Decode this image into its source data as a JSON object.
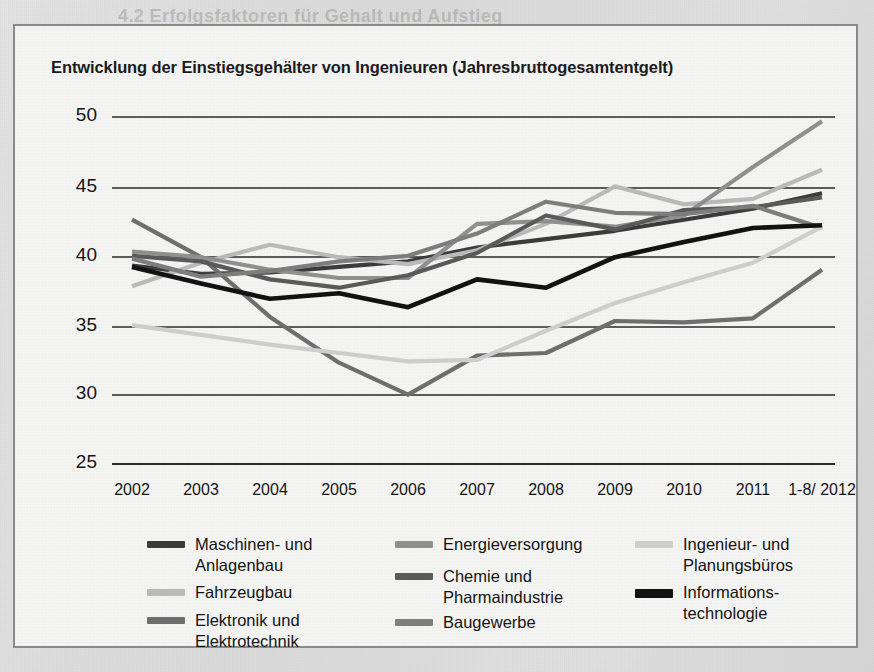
{
  "chart_card": {
    "title": "Entwicklung der Einstiegsgehälter von Ingenieuren (Jahresbruttogesamtentgelt)"
  },
  "background_bleed": [
    {
      "text": "4.2 Erfolgsfaktoren für Gehalt und Aufstieg",
      "x": 118,
      "y": 6,
      "size": 18,
      "bold": true
    },
    {
      "text": "4.2.1 Führung als Dienstleistung begreifen",
      "x": 120,
      "y": 88,
      "size": 15,
      "bold": true
    },
    {
      "text": "Wer andere motivieren und führen will, muss sich auf ihre Ansprüche einstellen und",
      "x": 122,
      "y": 140,
      "size": 12,
      "bold": false
    },
    {
      "text": "ihre Stärken erkennen. Wer gut führt, profitiert von Gestaltungsspielraum, besserer",
      "x": 122,
      "y": 168,
      "size": 12,
      "bold": false
    },
    {
      "text": "Bezahlung und mehr Ansehen. Dazu gehört es auch, Aufgaben abzugeben und",
      "x": 122,
      "y": 196,
      "size": 12,
      "bold": false
    },
    {
      "text": "Verantwortung zu delegieren. Wer alles selbst machen will, bremst das Team und",
      "x": 122,
      "y": 224,
      "size": 12,
      "bold": false
    },
    {
      "text": "sich selbst – und verliert den Blick für das Wesentliche im Unternehmen.",
      "x": 122,
      "y": 252,
      "size": 12,
      "bold": false
    },
    {
      "text": "Ein wichtiger Punkt: Investitionen in die eigene Weiterbildung zahlen sich aus.",
      "x": 122,
      "y": 300,
      "size": 12,
      "bold": false
    },
    {
      "text": "Wer Verantwortung übernimmt, muss auch Rückschläge einkalkulieren können.",
      "x": 122,
      "y": 328,
      "size": 12,
      "bold": false
    },
    {
      "text": "Planungssicherheit für den Arbeitgeber ist ein entscheidender Faktor.",
      "x": 122,
      "y": 356,
      "size": 12,
      "bold": false
    },
    {
      "text": "Ingenieure sind gefragt wie nie zuvor auf dem deutschen Arbeitsmarkt.",
      "x": 40,
      "y": 402,
      "size": 12,
      "bold": false
    },
    {
      "text": "53",
      "x": 810,
      "y": 636,
      "size": 13,
      "bold": true
    }
  ],
  "chart_data": {
    "type": "line",
    "title": "Entwicklung der Einstiegsgehälter von Ingenieuren (Jahresbruttogesamtentgelt)",
    "xlabel": "",
    "ylabel": "",
    "ylim": [
      25,
      50
    ],
    "yticks": [
      50,
      45,
      40,
      35,
      30,
      25
    ],
    "grid": true,
    "legend_position": "bottom",
    "categories": [
      "2002",
      "2003",
      "2004",
      "2005",
      "2006",
      "2007",
      "2008",
      "2009",
      "2010",
      "2011",
      "1-8/\n2012"
    ],
    "x_tick_labels": [
      "2002",
      "2003",
      "2004",
      "2005",
      "2006",
      "2007",
      "2008",
      "2009",
      "2010",
      "2011",
      "1-8/\n2012"
    ],
    "series": [
      {
        "name": "Maschinen- und\nAnlagenbau",
        "color": "#3b3b3b",
        "width": 4.2,
        "values": [
          39.3,
          38.7,
          38.8,
          39.2,
          39.6,
          40.6,
          41.2,
          41.8,
          42.6,
          43.4,
          44.5
        ]
      },
      {
        "name": "Fahrzeugbau",
        "color": "#b9b9b9",
        "width": 4.2,
        "values": [
          37.8,
          39.5,
          40.8,
          39.9,
          39.4,
          40.4,
          42.3,
          45.0,
          43.7,
          44.1,
          46.2
        ]
      },
      {
        "name": "Elektronik und\nElektrotechnik",
        "color": "#6e6e6e",
        "width": 4.2,
        "values": [
          42.6,
          39.9,
          35.6,
          32.3,
          30.0,
          32.8,
          33.0,
          35.3,
          35.2,
          35.5,
          39.0
        ]
      },
      {
        "name": "Energieversorgung",
        "color": "#8f8f8f",
        "width": 4.2,
        "values": [
          40.3,
          39.9,
          39.0,
          38.4,
          38.4,
          42.3,
          42.5,
          42.1,
          42.9,
          46.4,
          49.7
        ]
      },
      {
        "name": "Chemie und\nPharmaindustrie",
        "color": "#5a5a5a",
        "width": 4.2,
        "values": [
          40.0,
          39.6,
          38.3,
          37.7,
          38.6,
          40.2,
          42.9,
          41.9,
          43.3,
          43.5,
          44.2
        ]
      },
      {
        "name": "Baugewerbe",
        "color": "#7d7d7d",
        "width": 4.2,
        "values": [
          39.8,
          38.5,
          38.9,
          39.6,
          40.0,
          41.6,
          43.9,
          43.1,
          43.0,
          43.6,
          42.0
        ]
      },
      {
        "name": "Ingenieur- und\nPlanungsbüros",
        "color": "#cdcdcd",
        "width": 4.2,
        "values": [
          35.0,
          34.3,
          33.6,
          33.0,
          32.4,
          32.5,
          34.6,
          36.6,
          38.1,
          39.5,
          42.1
        ]
      },
      {
        "name": "Informations-\ntechnologie",
        "color": "#121212",
        "width": 4.6,
        "values": [
          39.2,
          38.0,
          36.9,
          37.3,
          36.3,
          38.3,
          37.7,
          39.9,
          41.0,
          42.0,
          42.2
        ]
      }
    ]
  },
  "legend": {
    "columns": [
      [
        {
          "label": "Maschinen- und\nAnlagenbau",
          "color": "#3b3b3b",
          "height": 7
        },
        {
          "label": "Fahrzeugbau",
          "color": "#b9b9b9",
          "height": 7
        },
        {
          "label": "Elektronik und\nElektrotechnik",
          "color": "#6e6e6e",
          "height": 7
        }
      ],
      [
        {
          "label": "Energieversorgung",
          "color": "#8f8f8f",
          "height": 7
        },
        {
          "label": "Chemie und\nPharmaindustrie",
          "color": "#5a5a5a",
          "height": 7
        },
        {
          "label": "Baugewerbe",
          "color": "#7d7d7d",
          "height": 7
        }
      ],
      [
        {
          "label": "Ingenieur- und\nPlanungsbüros",
          "color": "#cdcdcd",
          "height": 7
        },
        {
          "label": "Informations-\ntechnologie",
          "color": "#121212",
          "height": 9
        }
      ]
    ]
  }
}
